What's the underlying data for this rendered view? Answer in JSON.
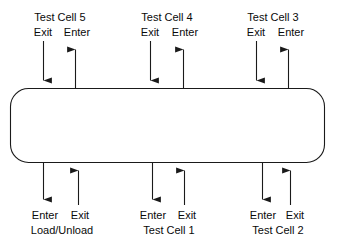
{
  "diagram": {
    "type": "material-handling-loop-flow-diagram",
    "shape": {
      "name": "conveyor-loop",
      "stroke_color": "#1a1a1a",
      "fill_color": "#ffffff"
    },
    "arrow_color": "#1a1a1a",
    "top_ports": [
      {
        "id": "test-cell-5",
        "title": "Test Cell 5",
        "exit_label": "Exit",
        "enter_label": "Enter"
      },
      {
        "id": "test-cell-4",
        "title": "Test Cell 4",
        "exit_label": "Exit",
        "enter_label": "Enter"
      },
      {
        "id": "test-cell-3",
        "title": "Test Cell 3",
        "exit_label": "Exit",
        "enter_label": "Enter"
      }
    ],
    "bottom_ports": [
      {
        "id": "load-unload",
        "title": "Load/Unload",
        "enter_label": "Enter",
        "exit_label": "Exit"
      },
      {
        "id": "test-cell-1",
        "title": "Test Cell 1",
        "enter_label": "Enter",
        "exit_label": "Exit"
      },
      {
        "id": "test-cell-2",
        "title": "Test Cell 2",
        "enter_label": "Enter",
        "exit_label": "Exit"
      }
    ]
  }
}
